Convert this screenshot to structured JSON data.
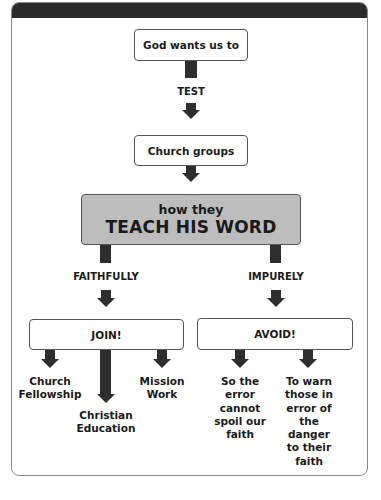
{
  "diagram": {
    "top_box": "God wants us to",
    "step_label": "TEST",
    "groups_box": "Church groups",
    "main_box": {
      "line1": "how they",
      "line2": "TEACH HIS WORD"
    },
    "branches": {
      "left": {
        "label": "FAITHFULLY",
        "action": "JOIN!",
        "outcomes": [
          "Church Fellowship",
          "Christian Education",
          "Mission Work"
        ]
      },
      "right": {
        "label": "IMPURELY",
        "action": "AVOID!",
        "outcomes": [
          "So the error cannot spoil our faith",
          "To warn those in error of the danger to their faith"
        ]
      }
    },
    "colors": {
      "header_bar": "#2b2b2b",
      "main_box_fill": "#bdbdbd",
      "arrows": "#2e2e2e",
      "border": "#8a8a8a"
    }
  }
}
